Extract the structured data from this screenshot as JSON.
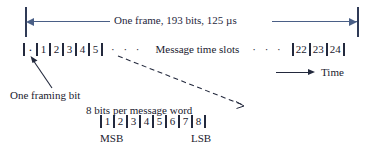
{
  "figure": {
    "colors": {
      "dimension_arrow": "#4a5f86",
      "tick": "#2f3a56",
      "text": "#1a1a2e",
      "background": "#ffffff"
    }
  },
  "frame_dimension": {
    "label": "One frame, 193 bits, 125 µs",
    "bits": 193,
    "duration": "125 µs"
  },
  "slot_row": {
    "framing_bit_mark": "·",
    "leading_slots": [
      "1",
      "2",
      "3",
      "4",
      "5"
    ],
    "ellipsis_left": "· · ·",
    "center_label": "Message time slots",
    "ellipsis_right": "· · ·",
    "trailing_slots": [
      "22",
      "23",
      "24"
    ]
  },
  "framing_bit_callout": {
    "label": "One framing bit"
  },
  "word_detail": {
    "label": "8 bits per message word",
    "bits": [
      "1",
      "2",
      "3",
      "4",
      "5",
      "6",
      "7",
      "8"
    ],
    "msb_label": "MSB",
    "lsb_label": "LSB"
  },
  "time_axis": {
    "label": "Time"
  }
}
